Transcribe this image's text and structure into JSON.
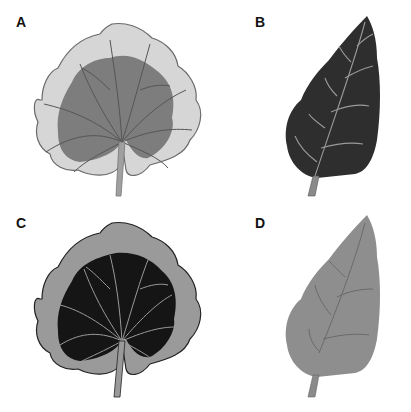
{
  "figure": {
    "panels": [
      {
        "label": "A",
        "description": "Variegated round leaf with light margin and medium-gray center",
        "colors": {
          "margin": "#d6d6d6",
          "center": "#7d7d7d",
          "veins": "#555555",
          "outline": "#6a6a6a"
        }
      },
      {
        "label": "B",
        "description": "Dark ovate leaf with light veins",
        "colors": {
          "blade": "#2e2e2e",
          "veins": "#9a9a9a",
          "petiole": "#8a8a8a"
        }
      },
      {
        "label": "C",
        "description": "Variegated round leaf with medium-gray margin and black center",
        "colors": {
          "margin": "#9a9a9a",
          "center": "#151515",
          "veins": "#9a9a9a",
          "outline": "#222222"
        }
      },
      {
        "label": "D",
        "description": "Medium-gray ovate leaf with darker veins",
        "colors": {
          "blade": "#8e8e8e",
          "veins": "#6a6a6a",
          "petiole": "#8a8a8a"
        }
      }
    ]
  }
}
